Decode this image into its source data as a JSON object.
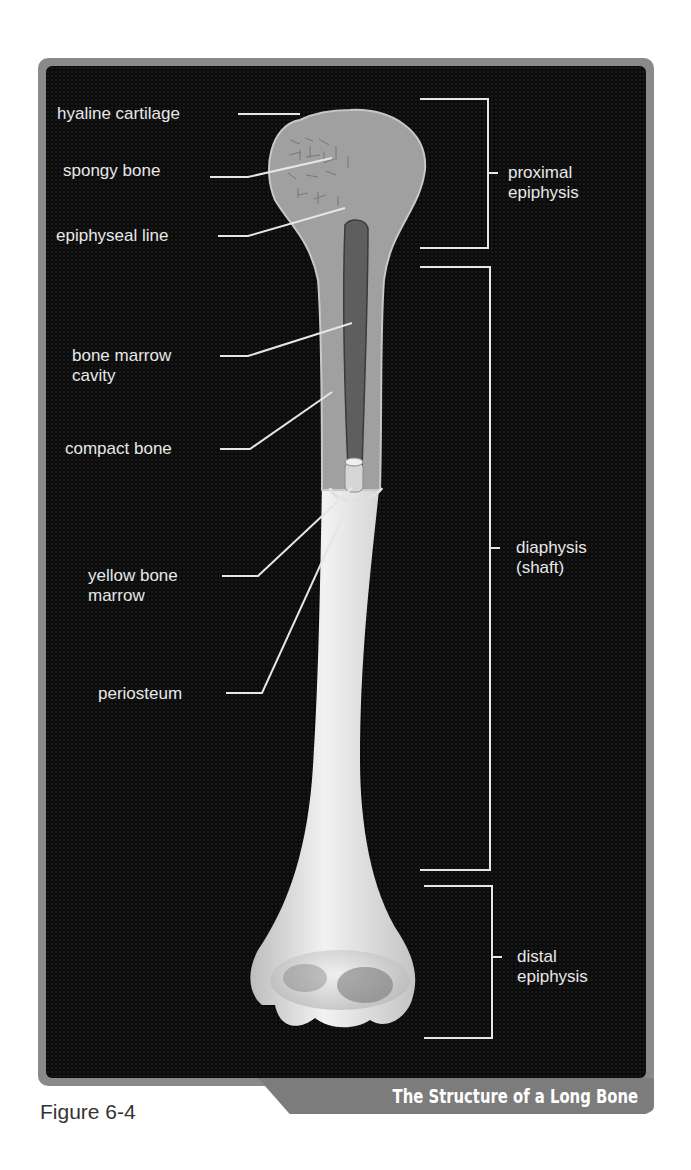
{
  "figure": {
    "number": "Figure 6-4",
    "title": "The Structure of a Long Bone"
  },
  "labels": {
    "hyaline_cartilage": "hyaline cartilage",
    "spongy_bone": "spongy bone",
    "epiphyseal_line": "epiphyseal line",
    "bone_marrow_cavity_1": "bone marrow",
    "bone_marrow_cavity_2": "cavity",
    "compact_bone": "compact bone",
    "yellow_bone_marrow_1": "yellow bone",
    "yellow_bone_marrow_2": "marrow",
    "periosteum": "periosteum"
  },
  "regions": {
    "proximal_1": "proximal",
    "proximal_2": "epiphysis",
    "diaphysis_1": "diaphysis",
    "diaphysis_2": "(shaft)",
    "distal_1": "distal",
    "distal_2": "epiphysis"
  },
  "colors": {
    "background": "#0c0c0c",
    "frame": "#8a8a8a",
    "label_text": "#e8e8e8",
    "bone": "#d8d8d8",
    "cut_bone": "#9a9a9a",
    "marrow_cavity": "#5e5e5e"
  }
}
